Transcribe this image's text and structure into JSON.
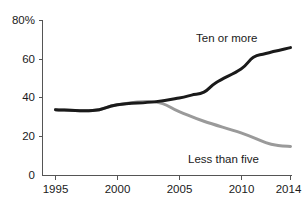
{
  "chart_data": {
    "type": "line",
    "title": "",
    "subtitle": "",
    "xlabel": "",
    "ylabel": "",
    "xlim": [
      1995,
      2014
    ],
    "ylim": [
      0,
      80
    ],
    "grid": false,
    "legend_position": "inline-annotation",
    "y_axis": {
      "tick_labels": [
        "80%",
        "60",
        "40",
        "20",
        "0"
      ],
      "tick_values": [
        80,
        60,
        40,
        20,
        0
      ],
      "unit": "%"
    },
    "x_axis": {
      "tick_labels": [
        "1995",
        "2000",
        "2005",
        "2010",
        "2014"
      ],
      "tick_values": [
        1995,
        2000,
        2005,
        2010,
        2014
      ]
    },
    "series": [
      {
        "name": "Ten or more",
        "color": "#1a1a1a",
        "label_text": "Ten or more",
        "x": [
          1995,
          1998,
          2000,
          2003,
          2005,
          2006,
          2007,
          2008,
          2010,
          2011,
          2012,
          2014
        ],
        "values": [
          34,
          33.5,
          36.5,
          38,
          40,
          41.5,
          43,
          48,
          55,
          61,
          63,
          66
        ]
      },
      {
        "name": "Less than five",
        "color": "#9a9a9a",
        "label_text": "Less than five",
        "x": [
          1995,
          1998,
          2000,
          2003,
          2005,
          2007,
          2010,
          2012,
          2013,
          2014
        ],
        "values": [
          34,
          33.5,
          36.5,
          38,
          33,
          28,
          22,
          17,
          15.5,
          15
        ]
      }
    ],
    "annotations": [
      {
        "text": "Ten or more",
        "series": "Ten or more",
        "x_px": 196,
        "y_px": 42
      },
      {
        "text": "Less than five",
        "series": "Less than five",
        "x_px": 188,
        "y_px": 163
      }
    ]
  }
}
